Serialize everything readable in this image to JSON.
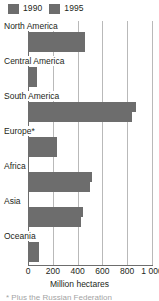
{
  "chart_data": {
    "type": "bar",
    "orientation": "horizontal",
    "title": "",
    "xlabel": "Million hectares",
    "ylabel": "",
    "xlim": [
      0,
      1000
    ],
    "xticks": [
      0,
      200,
      400,
      600,
      800,
      1000
    ],
    "xtick_labels": [
      "0",
      "200",
      "400",
      "600",
      "800",
      "1 000"
    ],
    "grid": true,
    "legend_position": "top-left",
    "categories": [
      "North America",
      "Central America",
      "South America",
      "Europe*",
      "Africa",
      "Asia",
      "Oceania"
    ],
    "series": [
      {
        "name": "1990",
        "color": "#6d6d6d",
        "values": [
          460,
          75,
          870,
          235,
          520,
          440,
          90
        ]
      },
      {
        "name": "1995",
        "color": "#6d6d6d",
        "values": [
          457,
          70,
          840,
          237,
          500,
          425,
          88
        ]
      }
    ],
    "footnote": "* Plus the Russian Federation"
  },
  "legend": {
    "entries": [
      {
        "label": "1990",
        "color": "#6d6d6d"
      },
      {
        "label": "1995",
        "color": "#6d6d6d"
      }
    ]
  },
  "axis": {
    "title": "Million hectares"
  }
}
